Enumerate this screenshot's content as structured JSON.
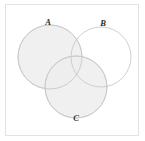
{
  "figure": {
    "type": "venn-diagram",
    "title": "",
    "frame": {
      "border_color": "#e2e2e2",
      "background_color": "#ffffff"
    },
    "style": {
      "circle_stroke_color": "#c9c9c9",
      "circle_fill_color": "#ededed",
      "circle_unfilled_color": "#ffffff",
      "label_color": "#2b2b2b"
    },
    "sets": [
      {
        "id": "A",
        "label": "A",
        "position": "top-left",
        "filled": true,
        "fill": "#ededed",
        "cx": 50,
        "cy": 57,
        "r": 32,
        "label_x": 48,
        "label_y": 23
      },
      {
        "id": "B",
        "label": "B",
        "position": "top-right",
        "filled": false,
        "fill": "#ffffff",
        "cx": 101,
        "cy": 57,
        "r": 30,
        "label_x": 103,
        "label_y": 24
      },
      {
        "id": "C",
        "label": "C",
        "position": "bottom-center",
        "filled": true,
        "fill": "#ededed",
        "cx": 76,
        "cy": 87,
        "r": 31,
        "label_x": 76,
        "label_y": 119
      }
    ]
  }
}
